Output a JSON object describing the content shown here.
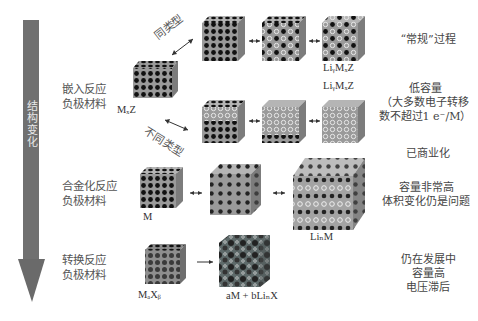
{
  "axis": {
    "label": "结构变化",
    "color": "#6e6e6e"
  },
  "categories": [
    {
      "id": "intercalation",
      "line1": "嵌入反应",
      "line2": "负极材料"
    },
    {
      "id": "alloying",
      "line1": "合金化反应",
      "line2": "负极材料"
    },
    {
      "id": "conversion",
      "line1": "转换反应",
      "line2": "负极材料"
    }
  ],
  "arrow_labels": {
    "same_type": "同类型",
    "different_type": "不同类型"
  },
  "formulas": {
    "mxz": "MₓZ",
    "li_y_m_x_z_top": "LiᵧMₓZ",
    "li_y_m_x_z_bottom": "LiᵧMₓZ",
    "m": "M",
    "li_n_m": "LiₙM",
    "m_a_x_b": "MₐXᵦ",
    "conversion_product": "aM + bLiₙX"
  },
  "notes": {
    "conventional": "“常规”过程",
    "low_capacity_1": "低容量",
    "low_capacity_2": "（大多数电子转移",
    "low_capacity_3": "数不超过1 e⁻/M）",
    "commercialized": "已商业化",
    "alloy_1": "容量非常高",
    "alloy_2": "体积变化仍是问题",
    "conversion_1": "仍在发展中",
    "conversion_2": "容量高",
    "conversion_3": "电压滞后"
  },
  "colors": {
    "cube_face": "#9a9a9a",
    "cube_top": "#b8b8b8",
    "cube_side": "#7c7c7c",
    "atom_host": "#1a1a1a",
    "atom_li": "#d8d8d8",
    "arrow": "#555555"
  }
}
